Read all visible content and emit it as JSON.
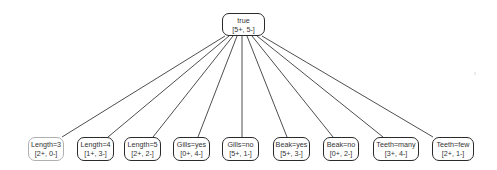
{
  "diagram": {
    "type": "tree",
    "root": {
      "id": "root",
      "label": "true",
      "counts": "[5+, 5-]",
      "box": {
        "x": 222,
        "y": 13,
        "w": 43,
        "h": 23
      }
    },
    "children": [
      {
        "id": "c0",
        "label": "Length=3",
        "counts": "[2+, 0-]",
        "faded": true,
        "box": {
          "x": 28,
          "y": 137,
          "w": 36,
          "h": 24
        },
        "edge_end_x": 62
      },
      {
        "id": "c1",
        "label": "Length=4",
        "counts": "[1+, 3-]",
        "faded": false,
        "box": {
          "x": 77,
          "y": 137,
          "w": 37,
          "h": 24
        },
        "edge_end_x": 108
      },
      {
        "id": "c2",
        "label": "Length=5",
        "counts": "[2+, 2-]",
        "faded": false,
        "box": {
          "x": 124,
          "y": 137,
          "w": 37,
          "h": 24
        },
        "edge_end_x": 153
      },
      {
        "id": "c3",
        "label": "Gills=yes",
        "counts": "[0+, 4-]",
        "faded": false,
        "box": {
          "x": 173,
          "y": 137,
          "w": 37,
          "h": 24
        },
        "edge_end_x": 198
      },
      {
        "id": "c4",
        "label": "Gills=no",
        "counts": "[5+, 1-]",
        "faded": false,
        "box": {
          "x": 222,
          "y": 137,
          "w": 37,
          "h": 24
        },
        "edge_end_x": 242
      },
      {
        "id": "c5",
        "label": "Beak=yes",
        "counts": "[5+, 3-]",
        "faded": false,
        "box": {
          "x": 273,
          "y": 137,
          "w": 37,
          "h": 24
        },
        "edge_end_x": 287
      },
      {
        "id": "c6",
        "label": "Beak=no",
        "counts": "[0+, 2-]",
        "faded": false,
        "box": {
          "x": 323,
          "y": 137,
          "w": 36,
          "h": 24
        },
        "edge_end_x": 333
      },
      {
        "id": "c7",
        "label": "Teeth=many",
        "counts": "[3+, 4-]",
        "faded": false,
        "box": {
          "x": 373,
          "y": 137,
          "w": 46,
          "h": 24
        },
        "edge_end_x": 383
      },
      {
        "id": "c8",
        "label": "Teeth=few",
        "counts": "[2+, 1-]",
        "faded": false,
        "box": {
          "x": 432,
          "y": 137,
          "w": 42,
          "h": 24
        },
        "edge_end_x": 433
      }
    ],
    "edge_start_xs": [
      225,
      229,
      233,
      237,
      242,
      247,
      252,
      257,
      262
    ],
    "edge_start_y": 36,
    "edge_end_y": 137,
    "colors": {
      "node_border": "#2a2a2a",
      "faded_border": "#b0b0b0",
      "edge": "#3a3a3a",
      "text": "#333333",
      "background": "#ffffff"
    }
  }
}
